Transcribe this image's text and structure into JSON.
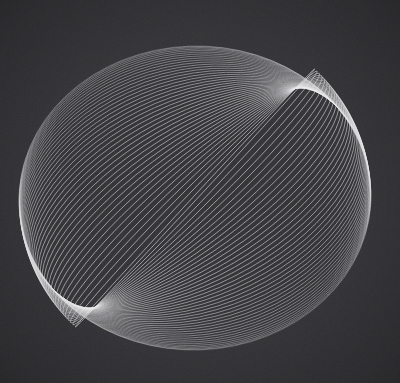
{
  "artwork": {
    "title": "Rotating Ellipse Family",
    "medium": "generative-line-art",
    "canvas": {
      "width": 400,
      "height": 383,
      "background_color": "#333336",
      "noise": true,
      "noise_opacity": 0.55,
      "vignette": true
    }
  },
  "chart_data": {
    "type": "line",
    "title": "Rotating Ellipse Family",
    "subtitle": "Concentric ellipses of constant major axis with decreasing minor axis and progressive rotation",
    "xlabel": "",
    "ylabel": "",
    "xlim": [
      0,
      400
    ],
    "ylim": [
      0,
      383
    ],
    "grid": false,
    "legend": false,
    "axes_visible": false,
    "center": {
      "x": 195,
      "y": 198
    },
    "semi_major_axis": 176,
    "semi_minor_axis_start": 152,
    "semi_minor_axis_end": 2,
    "rotation_start_deg": -2,
    "rotation_step_deg": -1.05,
    "ellipse_count": 44,
    "stroke_color": "#e8e8ea",
    "stroke_width": 0.62,
    "stroke_opacity_min": 0.42,
    "stroke_opacity_max": 0.82,
    "envelope_cusps": [
      {
        "name": "lower-left-cusp",
        "x": 75,
        "y": 280
      },
      {
        "name": "upper-right-cusp",
        "x": 310,
        "y": 118
      }
    ],
    "bright_band_angle_deg": -35,
    "bounds": {
      "left": 22,
      "top": 36,
      "right": 376,
      "bottom": 341
    },
    "series": [
      {
        "name": "ellipse-outer",
        "semi_minor": 152,
        "rotation_deg": -2
      },
      {
        "name": "ellipse-inner",
        "semi_minor": 2,
        "rotation_deg": -47
      }
    ]
  }
}
